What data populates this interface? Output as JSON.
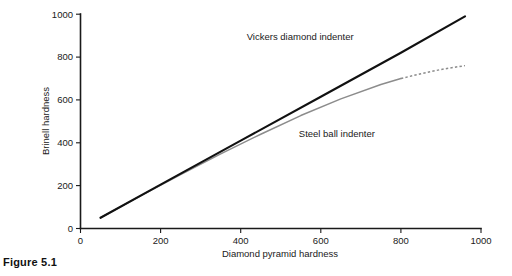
{
  "figure": {
    "caption": "Figure 5.1"
  },
  "chart_data": {
    "type": "line",
    "title": "",
    "xlabel": "Diamond pyramid hardness",
    "ylabel": "Brinell hardness",
    "xlim": [
      0,
      1000
    ],
    "ylim": [
      0,
      1000
    ],
    "xticks": [
      0,
      200,
      400,
      600,
      800,
      1000
    ],
    "xtick_labels": [
      "0",
      "200",
      "400",
      "600",
      "800",
      "1000"
    ],
    "yticks": [
      0,
      200,
      400,
      600,
      800,
      1000
    ],
    "ytick_labels": [
      "0",
      "200",
      "400",
      "600",
      "800",
      "1000"
    ],
    "grid": false,
    "legend": "inline-annotations",
    "series": [
      {
        "name": "Vickers diamond indenter",
        "color": "#111111",
        "style": "solid",
        "x": [
          50,
          200,
          400,
          600,
          800,
          960
        ],
        "values": [
          50,
          205,
          410,
          615,
          820,
          990
        ]
      },
      {
        "name": "Steel ball indenter",
        "color": "#8c8c8c",
        "style": "solid-then-dashed",
        "dash_starts_at_x": 800,
        "x": [
          50,
          150,
          250,
          350,
          450,
          550,
          650,
          750,
          800,
          850,
          900,
          960
        ],
        "values": [
          50,
          152,
          252,
          348,
          440,
          527,
          605,
          672,
          700,
          722,
          742,
          760
        ]
      }
    ],
    "annotations": [
      {
        "text": "Vickers diamond indenter",
        "x": 415,
        "y": 880
      },
      {
        "text": "Steel ball indenter",
        "x": 545,
        "y": 425
      }
    ]
  }
}
